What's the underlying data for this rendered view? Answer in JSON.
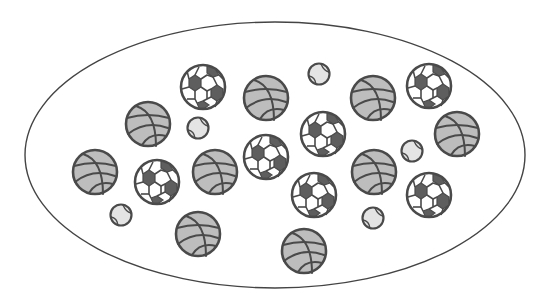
{
  "canvas": {
    "width": 550,
    "height": 302,
    "background": "#ffffff"
  },
  "boundary": {
    "shape": "ellipse",
    "cx": 275,
    "cy": 155,
    "rx": 250,
    "ry": 133,
    "stroke": "#444444"
  },
  "colors": {
    "basketball_fill": "#bdbdbd",
    "soccer_dark_patch": "#5e5e5e",
    "tennis_fill": "#e4e4e4",
    "outline": "#4a4a4a"
  },
  "counts": {
    "soccer": 7,
    "basketball": 9,
    "tennis": 5,
    "total": 21
  },
  "balls": [
    {
      "type": "soccer",
      "cx": 203,
      "cy": 87,
      "r": 23
    },
    {
      "type": "soccer",
      "cx": 157,
      "cy": 182,
      "r": 23
    },
    {
      "type": "soccer",
      "cx": 266,
      "cy": 157,
      "r": 23
    },
    {
      "type": "soccer",
      "cx": 323,
      "cy": 134,
      "r": 23
    },
    {
      "type": "soccer",
      "cx": 314,
      "cy": 195,
      "r": 23
    },
    {
      "type": "soccer",
      "cx": 429,
      "cy": 86,
      "r": 23
    },
    {
      "type": "soccer",
      "cx": 429,
      "cy": 195,
      "r": 23
    },
    {
      "type": "basketball",
      "cx": 148,
      "cy": 124,
      "r": 23
    },
    {
      "type": "basketball",
      "cx": 266,
      "cy": 98,
      "r": 23
    },
    {
      "type": "basketball",
      "cx": 95,
      "cy": 172,
      "r": 23
    },
    {
      "type": "basketball",
      "cx": 215,
      "cy": 172,
      "r": 23
    },
    {
      "type": "basketball",
      "cx": 373,
      "cy": 98,
      "r": 23
    },
    {
      "type": "basketball",
      "cx": 457,
      "cy": 134,
      "r": 23
    },
    {
      "type": "basketball",
      "cx": 374,
      "cy": 172,
      "r": 23
    },
    {
      "type": "basketball",
      "cx": 198,
      "cy": 234,
      "r": 23
    },
    {
      "type": "basketball",
      "cx": 304,
      "cy": 251,
      "r": 23
    },
    {
      "type": "tennis",
      "cx": 198,
      "cy": 128,
      "r": 11
    },
    {
      "type": "tennis",
      "cx": 319,
      "cy": 74,
      "r": 11
    },
    {
      "type": "tennis",
      "cx": 121,
      "cy": 215,
      "r": 11
    },
    {
      "type": "tennis",
      "cx": 412,
      "cy": 151,
      "r": 11
    },
    {
      "type": "tennis",
      "cx": 373,
      "cy": 218,
      "r": 11
    }
  ]
}
